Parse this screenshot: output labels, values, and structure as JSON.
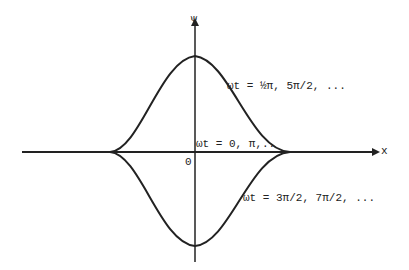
{
  "diagram": {
    "axes": {
      "y_label": "ψ",
      "x_label": "x",
      "origin_label": "0"
    },
    "curves": [
      {
        "name": "positive-peak",
        "label": "ωt = ½π, 5π/2, ..."
      },
      {
        "name": "zero-line",
        "label": "ωt = 0, π,.."
      },
      {
        "name": "negative-peak",
        "label": "ωt = 3π/2, 7π/2, ..."
      }
    ],
    "colors": {
      "ink": "#222222",
      "background": "#ffffff"
    }
  }
}
